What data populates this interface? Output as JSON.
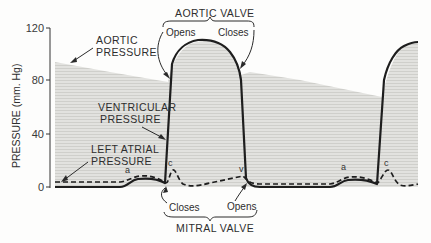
{
  "figure": {
    "y_axis": {
      "label": "PRESSURE (mm. Hg)",
      "ticks": [
        "0",
        "40",
        "80",
        "120"
      ]
    },
    "labels": {
      "aortic_pressure_line1": "AORTIC",
      "aortic_pressure_line2": "PRESSURE",
      "ventricular_pressure_line1": "VENTRICULAR",
      "ventricular_pressure_line2": "PRESSURE",
      "left_atrial_pressure_line1": "LEFT ATRIAL",
      "left_atrial_pressure_line2": "PRESSURE",
      "aortic_valve": "AORTIC VALVE",
      "aortic_opens": "Opens",
      "aortic_closes": "Closes",
      "mitral_valve": "MITRAL VALVE",
      "mitral_closes": "Closes",
      "mitral_opens": "Opens"
    },
    "wave_labels": {
      "a1": "a",
      "c1": "c",
      "v1": "v",
      "a2": "a",
      "c2": "c"
    },
    "colors": {
      "line": "#1e1e1e",
      "shading": "#d9d9d6",
      "shading_stripe": "#c9c9c5",
      "text": "#2e2e2e"
    }
  }
}
